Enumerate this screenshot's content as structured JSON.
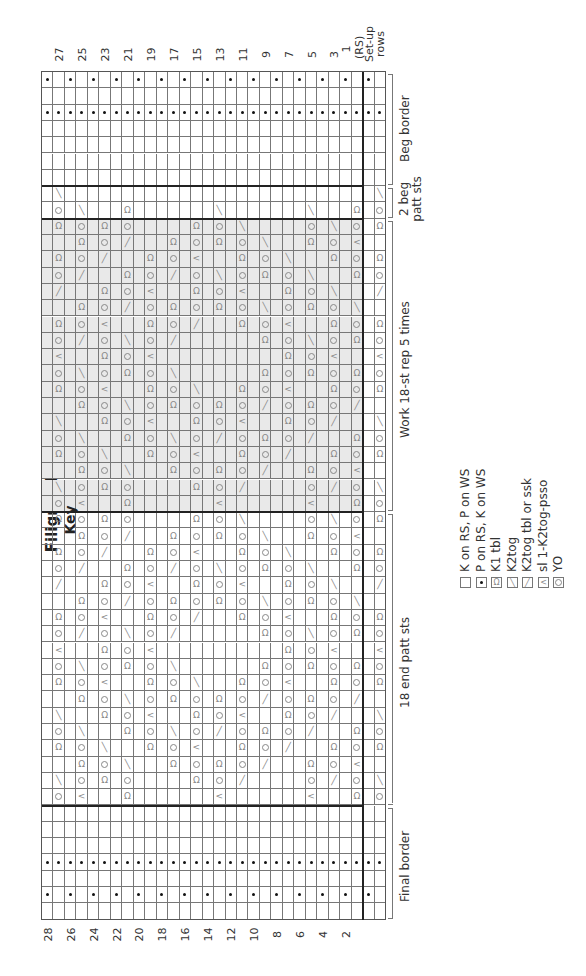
{
  "title": "Filigree Diamond",
  "colors": {
    "grid_line": "#777777",
    "thick_line": "#222222",
    "repeat_shade": "#e9e9e9",
    "symbol": "#888888",
    "purl_dot": "#111111"
  },
  "chart_data": {
    "type": "table",
    "title": "Filigree Diamond",
    "orientation": "rotated -90deg (chart rows run left-to-right as image columns)",
    "columns_rows": [
      "28",
      "27",
      "26",
      "25",
      "24",
      "23",
      "22",
      "21",
      "20",
      "19",
      "18",
      "17",
      "16",
      "15",
      "14",
      "13",
      "12",
      "11",
      "10",
      "9",
      "8",
      "7",
      "6",
      "5",
      "4",
      "3",
      "2",
      "1 (RS)",
      "setup-1",
      "setup-2"
    ],
    "odd_row_labels": [
      "27",
      "25",
      "23",
      "21",
      "19",
      "17",
      "15",
      "13",
      "11",
      "9",
      "7",
      "5",
      "3",
      "1 (RS)"
    ],
    "even_row_labels": [
      "28",
      "26",
      "24",
      "22",
      "20",
      "18",
      "16",
      "14",
      "12",
      "10",
      "8",
      "6",
      "4",
      "2"
    ],
    "setup_label": "Set-up rows",
    "stitch_sections": [
      {
        "label": "Beg border",
        "stitches": 7
      },
      {
        "label": "2 beg patt sts",
        "stitches": 2
      },
      {
        "label": "Work 18-st rep 5 times",
        "stitches": 18,
        "shaded": true
      },
      {
        "label": "18 end patt sts",
        "stitches": 18
      },
      {
        "label": "Final border",
        "stitches": 7
      }
    ],
    "symbol_codes": {
      "": "K on RS, P on WS",
      "p": "P on RS, K on WS",
      "t": "K1 tbl",
      "r": "K2tog",
      "l": "K2tog tbl or ssk",
      "c": "sl 1-K2tog-psso",
      "o": "YO"
    },
    "cells_note": "cells[stitch][column] — sparse list of non-blank symbols per stitch row",
    "cells": {
      "0": {
        "0": "p",
        "2": "p",
        "4": "p",
        "6": "p",
        "8": "p",
        "10": "p",
        "12": "p",
        "14": "p",
        "16": "p",
        "18": "p",
        "20": "p",
        "22": "p",
        "24": "p",
        "26": "p",
        "28": "p"
      },
      "2": "all-p",
      "7": {
        "1": "l",
        "29": "l"
      },
      "8": {
        "1": "o",
        "3": "l",
        "7": "t",
        "15": "l",
        "23": "l",
        "27": "t",
        "29": "o"
      },
      "9": {
        "1": "t",
        "3": "o",
        "5": "t",
        "7": "o",
        "13": "t",
        "15": "o",
        "17": "l",
        "23": "o",
        "25": "l",
        "27": "o",
        "29": "t"
      },
      "10": {
        "3": "t",
        "5": "o",
        "7": "r",
        "11": "t",
        "13": "o",
        "15": "t",
        "17": "o",
        "19": "l",
        "23": "t",
        "25": "o",
        "27": "c"
      },
      "11": {
        "1": "t",
        "3": "o",
        "5": "r",
        "9": "t",
        "11": "o",
        "13": "c",
        "17": "t",
        "19": "o",
        "21": "l",
        "25": "t",
        "27": "o",
        "29": "t"
      },
      "12": {
        "1": "o",
        "3": "r",
        "7": "t",
        "9": "o",
        "11": "r",
        "13": "o",
        "15": "l",
        "17": "o",
        "19": "t",
        "21": "o",
        "23": "l",
        "27": "t",
        "29": "o"
      },
      "13": {
        "1": "r",
        "5": "t",
        "7": "o",
        "9": "c",
        "13": "t",
        "15": "o",
        "17": "c",
        "21": "t",
        "23": "o",
        "25": "l",
        "29": "r"
      },
      "14": {
        "3": "t",
        "5": "o",
        "7": "r",
        "9": "o",
        "11": "t",
        "13": "o",
        "15": "t",
        "17": "o",
        "19": "l",
        "21": "o",
        "23": "t",
        "25": "o",
        "27": "l"
      },
      "15": {
        "1": "t",
        "3": "o",
        "5": "c",
        "9": "t",
        "11": "o",
        "13": "r",
        "17": "t",
        "19": "o",
        "21": "c",
        "25": "t",
        "27": "o",
        "29": "t"
      },
      "16": {
        "1": "o",
        "3": "r",
        "5": "o",
        "7": "l",
        "9": "o",
        "11": "r",
        "19": "t",
        "21": "o",
        "23": "l",
        "25": "o",
        "27": "t",
        "29": "o"
      },
      "17": {
        "1": "c",
        "5": "t",
        "7": "o",
        "9": "c",
        "21": "t",
        "23": "o",
        "25": "c",
        "29": "c"
      },
      "18": {
        "1": "o",
        "3": "l",
        "5": "o",
        "7": "t",
        "9": "o",
        "11": "l",
        "19": "t",
        "21": "o",
        "23": "t",
        "25": "o",
        "27": "t",
        "29": "o"
      },
      "19": {
        "1": "t",
        "3": "o",
        "5": "c",
        "9": "t",
        "11": "o",
        "13": "l",
        "17": "t",
        "19": "o",
        "21": "c",
        "25": "t",
        "27": "o",
        "29": "t"
      },
      "20": {
        "3": "t",
        "5": "o",
        "7": "l",
        "9": "o",
        "11": "t",
        "13": "o",
        "15": "t",
        "17": "o",
        "19": "r",
        "21": "o",
        "23": "t",
        "25": "o",
        "27": "r"
      },
      "21": {
        "1": "l",
        "5": "t",
        "7": "o",
        "9": "c",
        "13": "t",
        "15": "o",
        "17": "c",
        "21": "t",
        "23": "o",
        "25": "r",
        "29": "l"
      },
      "22": {
        "1": "o",
        "3": "l",
        "7": "t",
        "9": "o",
        "11": "l",
        "13": "o",
        "15": "r",
        "17": "o",
        "19": "t",
        "21": "o",
        "23": "r",
        "27": "t",
        "29": "o"
      },
      "23": {
        "1": "t",
        "3": "o",
        "5": "l",
        "9": "t",
        "11": "o",
        "13": "c",
        "17": "t",
        "19": "o",
        "21": "r",
        "25": "t",
        "27": "o",
        "29": "t"
      },
      "24": {
        "3": "t",
        "5": "o",
        "7": "l",
        "11": "t",
        "13": "o",
        "15": "t",
        "17": "o",
        "19": "r",
        "23": "t",
        "25": "o",
        "27": "c"
      },
      "25": {
        "1": "l",
        "3": "o",
        "5": "t",
        "7": "o",
        "13": "t",
        "15": "o",
        "17": "r",
        "23": "o",
        "25": "r",
        "27": "o",
        "29": "l"
      },
      "26": {
        "1": "o",
        "3": "c",
        "7": "t",
        "15": "c",
        "23": "c",
        "27": "t",
        "29": "o"
      },
      "end_patt_repeats_from": 9,
      "48": "all-p",
      "50": {
        "0": "p",
        "2": "p",
        "4": "p",
        "6": "p",
        "8": "p",
        "10": "p",
        "12": "p",
        "14": "p",
        "16": "p",
        "18": "p",
        "20": "p",
        "22": "p",
        "24": "p",
        "26": "p",
        "28": "p"
      }
    }
  },
  "key": {
    "title": "Key",
    "items": [
      {
        "symbol": "blank",
        "label": "K on RS, P on WS"
      },
      {
        "symbol": "purl-dot",
        "glyph": "•",
        "label": "P on RS, K on WS"
      },
      {
        "symbol": "k1-tbl",
        "glyph": "Ω",
        "label": "K1 tbl"
      },
      {
        "symbol": "k2tog",
        "glyph": "╲",
        "label": "K2tog"
      },
      {
        "symbol": "ssk",
        "glyph": "╱",
        "label": "K2tog tbl or ssk"
      },
      {
        "symbol": "sl1-k2tog-psso",
        "glyph": "<",
        "label": "sl 1-K2tog-psso"
      },
      {
        "symbol": "yo",
        "glyph": "○",
        "label": "YO"
      }
    ]
  },
  "labels": {
    "beg_border": "Beg border",
    "beg_patt": "2 beg patt sts",
    "rep": "Work 18-st rep 5 times",
    "end_patt": "18 end patt sts",
    "final_border": "Final border",
    "setup": "Set-up rows"
  }
}
